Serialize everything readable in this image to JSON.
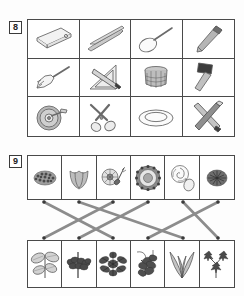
{
  "page": {
    "background_color": "#fdfdfd",
    "border_color": "#4a4a4a",
    "ink_color": "#555555",
    "connector_color": "#8c8c8c"
  },
  "exercises": [
    {
      "number": "8",
      "type": "picture-grid",
      "columns": 4,
      "rows": 3,
      "cells": [
        {
          "icon": "cutting-board-icon",
          "label": "cutting board"
        },
        {
          "icon": "chopsticks-icon",
          "label": "chopsticks"
        },
        {
          "icon": "spoon-icon",
          "label": "spoon"
        },
        {
          "icon": "pen-icon",
          "label": "pen"
        },
        {
          "icon": "fork-icon",
          "label": "fork"
        },
        {
          "icon": "set-square-icon",
          "label": "set square and pen"
        },
        {
          "icon": "basket-icon",
          "label": "basket"
        },
        {
          "icon": "mallet-icon",
          "label": "mallet"
        },
        {
          "icon": "pizza-cutter-icon",
          "label": "pizza cutter"
        },
        {
          "icon": "scissors-icon",
          "label": "scissors"
        },
        {
          "icon": "plate-icon",
          "label": "plate"
        },
        {
          "icon": "crossed-chisels-icon",
          "label": "crossed chisels"
        }
      ]
    },
    {
      "number": "9",
      "type": "matching",
      "columns": 6,
      "top_row": [
        {
          "icon": "flower-cluster-icon",
          "label": "flower cluster"
        },
        {
          "icon": "tulip-flower-icon",
          "label": "tulip flower"
        },
        {
          "icon": "pollinated-flower-icon",
          "label": "flower with bee"
        },
        {
          "icon": "daisy-flower-icon",
          "label": "daisy flower"
        },
        {
          "icon": "rose-flower-icon",
          "label": "rose flower"
        },
        {
          "icon": "thistle-flower-icon",
          "label": "thistle flower"
        }
      ],
      "bottom_row": [
        {
          "icon": "broad-leaf-plant-icon",
          "label": "broad leaf plant"
        },
        {
          "icon": "hedge-plant-icon",
          "label": "hedge plant"
        },
        {
          "icon": "star-leaf-plant-icon",
          "label": "star leaf plant"
        },
        {
          "icon": "vine-plant-icon",
          "label": "vine plant"
        },
        {
          "icon": "grass-plant-icon",
          "label": "grass plant"
        },
        {
          "icon": "maple-leaf-plant-icon",
          "label": "maple leaf plant"
        }
      ],
      "connections": [
        {
          "from": 0,
          "to": 2
        },
        {
          "from": 1,
          "to": 4
        },
        {
          "from": 2,
          "to": 0
        },
        {
          "from": 3,
          "to": 1
        },
        {
          "from": 4,
          "to": 5
        },
        {
          "from": 5,
          "to": 3
        }
      ]
    }
  ]
}
